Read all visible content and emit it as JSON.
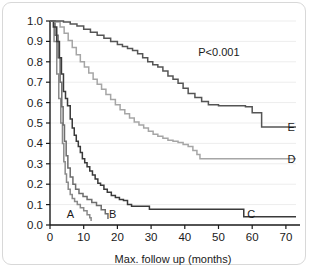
{
  "figure": {
    "annotation": "P<0.001",
    "background": "#ffffff",
    "border_color": "#d8d8d8"
  },
  "labels": {
    "A": "A",
    "B": "B",
    "C": "C",
    "D": "D",
    "E": "E"
  },
  "chart_data": {
    "type": "line",
    "title": "",
    "subtitle": "",
    "xlabel": "Max. follow up (months)",
    "ylabel": "",
    "xlim": [
      0,
      73
    ],
    "ylim": [
      0.0,
      1.0
    ],
    "xticks": [
      0,
      10,
      20,
      30,
      40,
      50,
      60,
      70
    ],
    "xticklabels": [
      "0",
      "10",
      "20",
      "30",
      "40",
      "50",
      "60",
      "70"
    ],
    "yticks": [
      0.0,
      0.1,
      0.2,
      0.3,
      0.4,
      0.5,
      0.6,
      0.7,
      0.8,
      0.9,
      1.0
    ],
    "yticklabels": [
      "0.0",
      "0.1",
      "0.2",
      "0.3",
      "0.4",
      "0.5",
      "0.6",
      "0.7",
      "0.8",
      "0.9",
      "1.0"
    ],
    "grid": true,
    "grid_axis": "y",
    "legend": "inline-end-labels",
    "annotations": [
      {
        "text": "P<0.001",
        "x": 44,
        "y": 0.83
      }
    ],
    "interpolation": "step-post",
    "series": [
      {
        "name": "A",
        "color": "#8a8a8a",
        "label_x": 5,
        "label_y": 0.055,
        "x": [
          0,
          1.2,
          2.0,
          2.6,
          3.2,
          3.7,
          4.1,
          4.5,
          4.9,
          5.4,
          6.0,
          6.6,
          7.3,
          8.1,
          9.0,
          10.0,
          11.0,
          11.8,
          12.2
        ],
        "y": [
          1.0,
          0.9,
          0.74,
          0.62,
          0.5,
          0.4,
          0.31,
          0.25,
          0.21,
          0.175,
          0.15,
          0.13,
          0.115,
          0.1,
          0.085,
          0.07,
          0.05,
          0.035,
          0.02
        ]
      },
      {
        "name": "B",
        "color": "#6e6e6e",
        "label_x": 17.5,
        "label_y": 0.055,
        "x": [
          0,
          1.5,
          2.4,
          3.0,
          3.5,
          3.9,
          4.3,
          4.8,
          5.3,
          6.0,
          6.8,
          7.6,
          8.6,
          9.8,
          11.0,
          12.4,
          13.8,
          15.2,
          16.4,
          17.2
        ],
        "y": [
          1.0,
          0.93,
          0.82,
          0.7,
          0.58,
          0.49,
          0.41,
          0.34,
          0.28,
          0.235,
          0.2,
          0.175,
          0.155,
          0.14,
          0.125,
          0.11,
          0.095,
          0.075,
          0.055,
          0.03
        ]
      },
      {
        "name": "C",
        "color": "#3a3a3a",
        "label_x": 58.5,
        "label_y": 0.055,
        "x": [
          0,
          1.0,
          2.0,
          2.8,
          3.4,
          4.0,
          4.6,
          5.2,
          6.0,
          6.6,
          7.2,
          7.8,
          8.4,
          9.0,
          9.6,
          10.3,
          11.0,
          11.8,
          12.6,
          13.4,
          14.2,
          15.0,
          16.0,
          17.0,
          18.2,
          19.4,
          20.6,
          21.8,
          23.0,
          24.2,
          29.5,
          55.0,
          57.5,
          73
        ],
        "y": [
          1.0,
          0.97,
          0.9,
          0.82,
          0.74,
          0.655,
          0.62,
          0.585,
          0.52,
          0.475,
          0.44,
          0.41,
          0.385,
          0.355,
          0.325,
          0.305,
          0.285,
          0.265,
          0.245,
          0.225,
          0.205,
          0.195,
          0.175,
          0.16,
          0.145,
          0.135,
          0.125,
          0.12,
          0.1,
          0.092,
          0.077,
          0.077,
          0.04,
          0.04
        ]
      },
      {
        "name": "D",
        "color": "#a6a6a6",
        "label_x": 70.5,
        "label_y": 0.325,
        "x": [
          0,
          1.5,
          3.0,
          4.2,
          5.4,
          6.6,
          7.8,
          9.0,
          10.2,
          11.5,
          12.8,
          14.0,
          15.3,
          16.6,
          18.0,
          19.4,
          20.8,
          22.2,
          23.6,
          25.0,
          26.4,
          27.8,
          29.2,
          30.6,
          32.0,
          33.5,
          35.0,
          36.5,
          38.0,
          39.5,
          41.0,
          42.4,
          43.6,
          44.5,
          73
        ],
        "y": [
          1.0,
          0.995,
          0.97,
          0.94,
          0.905,
          0.87,
          0.835,
          0.8,
          0.775,
          0.745,
          0.715,
          0.69,
          0.665,
          0.64,
          0.615,
          0.59,
          0.565,
          0.545,
          0.525,
          0.505,
          0.49,
          0.475,
          0.46,
          0.445,
          0.435,
          0.425,
          0.415,
          0.41,
          0.405,
          0.395,
          0.385,
          0.365,
          0.345,
          0.325,
          0.325
        ]
      },
      {
        "name": "E",
        "color": "#555555",
        "label_x": 70.5,
        "label_y": 0.48,
        "x": [
          0,
          2.0,
          4.0,
          6.0,
          8.0,
          10.0,
          12.0,
          14.0,
          16.0,
          18.0,
          20.0,
          21.5,
          23.0,
          24.5,
          26.0,
          27.5,
          29.0,
          30.5,
          32.0,
          33.5,
          35.0,
          36.5,
          38.0,
          39.5,
          41.0,
          43.0,
          45.0,
          47.0,
          50.0,
          54.0,
          58.0,
          60.0,
          62.0,
          62.8,
          73
        ],
        "y": [
          1.0,
          1.0,
          0.995,
          0.985,
          0.975,
          0.96,
          0.945,
          0.93,
          0.915,
          0.9,
          0.885,
          0.875,
          0.865,
          0.855,
          0.84,
          0.82,
          0.8,
          0.785,
          0.775,
          0.755,
          0.73,
          0.715,
          0.695,
          0.67,
          0.645,
          0.625,
          0.605,
          0.59,
          0.585,
          0.585,
          0.58,
          0.55,
          0.55,
          0.48,
          0.48
        ]
      }
    ]
  }
}
